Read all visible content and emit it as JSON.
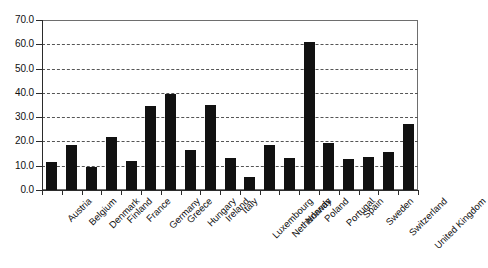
{
  "chart_data": {
    "type": "bar",
    "title": "",
    "subtitle": "",
    "xlabel": "",
    "ylabel": "",
    "ylim": [
      0.0,
      70.0
    ],
    "ytick_step": 10.0,
    "ytick_labels": [
      "0.0",
      "10.0",
      "20.0",
      "30.0",
      "40.0",
      "50.0",
      "60.0",
      "70.0"
    ],
    "ytick_values": [
      0.0,
      10.0,
      20.0,
      30.0,
      40.0,
      50.0,
      60.0,
      70.0
    ],
    "grid": "horizontal-dashed",
    "legend": "none",
    "bar_color": "#111111",
    "categories": [
      "Austria",
      "Belgium",
      "Denmark",
      "Finland",
      "France",
      "Germany",
      "Greece",
      "Hungary",
      "Ireland",
      "Italy",
      "Luxembourg",
      "Netherlands",
      "Norway",
      "Poland",
      "Portugal",
      "Spain",
      "Sweden",
      "Switzerland",
      "United Kingdom"
    ],
    "values": [
      11.5,
      18.5,
      9.5,
      22.0,
      12.0,
      34.5,
      39.5,
      16.3,
      35.2,
      13.2,
      5.3,
      18.4,
      13.0,
      61.0,
      19.3,
      12.8,
      13.8,
      15.8,
      27.0
    ]
  }
}
